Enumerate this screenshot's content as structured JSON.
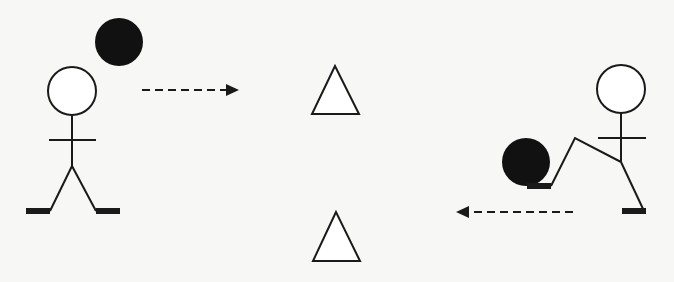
{
  "diagram": {
    "description": "Soccer passing drill: two players pass a ball through two cone markers",
    "colors": {
      "ink": "#1a1a1a",
      "background": "#f7f7f5",
      "cone_fill": "#ffffff"
    },
    "players": [
      {
        "id": "left-player",
        "pose": "standing",
        "head": {
          "cx": 72,
          "cy": 91,
          "r": 24
        }
      },
      {
        "id": "right-player",
        "pose": "kicking",
        "head": {
          "cx": 621,
          "cy": 89,
          "r": 24
        }
      }
    ],
    "balls": [
      {
        "id": "ball-top-left",
        "cx": 119,
        "cy": 42,
        "r": 24
      },
      {
        "id": "ball-right-player",
        "cx": 526,
        "cy": 162,
        "r": 24
      }
    ],
    "cones": [
      {
        "id": "cone-top",
        "apex": [
          335,
          66
        ],
        "base_y": 114,
        "x1": 312,
        "x2": 359
      },
      {
        "id": "cone-bottom",
        "apex": [
          336,
          212
        ],
        "base_y": 261,
        "x1": 313,
        "x2": 360
      }
    ],
    "arrows": [
      {
        "id": "pass-arrow-right",
        "direction": "right",
        "x1": 142,
        "x2": 238,
        "y": 90,
        "style": "dashed"
      },
      {
        "id": "pass-arrow-left",
        "direction": "left",
        "x1": 574,
        "x2": 457,
        "y": 212,
        "style": "dashed"
      }
    ]
  }
}
